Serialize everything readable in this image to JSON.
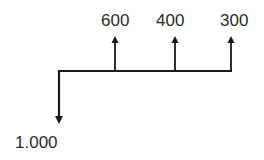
{
  "diagram": {
    "type": "cash-flow",
    "outflow": {
      "label": "1.000",
      "direction": "down"
    },
    "inflows": [
      {
        "label": "600",
        "direction": "up"
      },
      {
        "label": "400",
        "direction": "up"
      },
      {
        "label": "300",
        "direction": "up"
      }
    ],
    "colors": {
      "line": "#1a1a1a",
      "text": "#2b2b2b",
      "background": "#ffffff"
    }
  }
}
